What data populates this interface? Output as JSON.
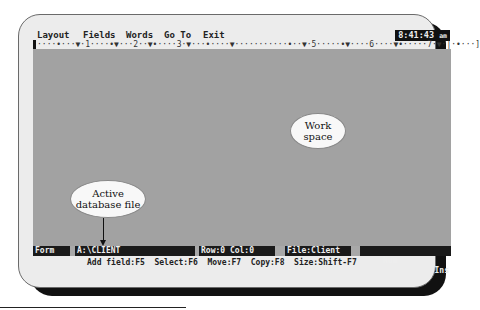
{
  "menu": {
    "items": [
      {
        "label": "Layout",
        "x": 4
      },
      {
        "label": "Fields",
        "x": 50
      },
      {
        "label": "Words",
        "x": 93
      },
      {
        "label": "Go To",
        "x": 131
      },
      {
        "label": "Exit",
        "x": 170
      }
    ],
    "clock": "8:41:43",
    "clock_ampm": "am"
  },
  "ruler": {
    "text": "····•···▼·1····•▼···2··▼•····3·▼···•····▼···········•··▼·5·····•▼····6····▼•·····7·▼·|·•···]"
  },
  "status_bar": {
    "mode": "Form",
    "path": "A:\\CLIENT",
    "position": "Row:0 Col:0",
    "file": "File:Client",
    "num": "Num",
    "ins": "Ins"
  },
  "help_line": "Add field:F5  Select:F6  Move:F7  Copy:F8  Size:Shift-F7",
  "callouts": {
    "active_db": {
      "line1": "Active",
      "line2": "database file"
    },
    "workspace": {
      "line1": "Work",
      "line2": "space"
    }
  }
}
